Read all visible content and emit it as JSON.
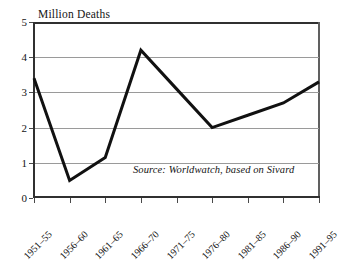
{
  "figure": {
    "name": "million-deaths-by-period-line-chart"
  },
  "annotations": {
    "source_note": "Source: Worldwatch, based on Sivard"
  },
  "chart_data": {
    "type": "line",
    "title": "",
    "ylabel": "Million Deaths",
    "xlabel": "",
    "categories": [
      "1951–55",
      "1956–60",
      "1961–65",
      "1966–70",
      "1971–75",
      "1976–80",
      "1981–85",
      "1986–90",
      "1991–95"
    ],
    "values": [
      3.4,
      0.5,
      1.15,
      4.2,
      3.1,
      2.0,
      2.35,
      2.7,
      3.3
    ],
    "ylim": [
      0,
      5
    ],
    "yticks": [
      0,
      1,
      2,
      3,
      4,
      5
    ],
    "ytick_labels": [
      "0",
      "1",
      "2",
      "3",
      "4",
      "5"
    ],
    "grid": true,
    "grid_axis": "y",
    "legend": false,
    "series_color": "#111111",
    "grid_color": "#9a9a9a",
    "axis_color": "#303030",
    "line_width": 3
  }
}
